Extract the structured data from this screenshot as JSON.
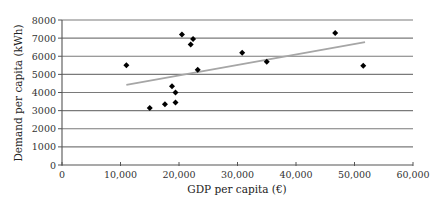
{
  "chart_data": {
    "type": "scatter",
    "title": "",
    "xlabel": "GDP per capita (€)",
    "ylabel": "Demand per capita (kWh)",
    "xlim": [
      0,
      60000
    ],
    "ylim": [
      0,
      8000
    ],
    "x_ticks": [
      0,
      10000,
      20000,
      30000,
      40000,
      50000,
      60000
    ],
    "x_tick_labels": [
      "0",
      "10,000",
      "20,000",
      "30,000",
      "40,000",
      "50,000",
      "60,000"
    ],
    "y_ticks": [
      0,
      1000,
      2000,
      3000,
      4000,
      5000,
      6000,
      7000,
      8000
    ],
    "y_tick_labels": [
      "0",
      "1000",
      "2000",
      "3000",
      "4000",
      "5000",
      "6000",
      "7000",
      "8000"
    ],
    "grid": {
      "horizontal": true,
      "vertical": false
    },
    "legend": null,
    "series": [
      {
        "name": "Countries",
        "marker": "diamond",
        "color": "#000000",
        "points": [
          {
            "x": 11000,
            "y": 5500
          },
          {
            "x": 15000,
            "y": 3150
          },
          {
            "x": 17600,
            "y": 3350
          },
          {
            "x": 18800,
            "y": 4350
          },
          {
            "x": 19400,
            "y": 4000
          },
          {
            "x": 19400,
            "y": 3450
          },
          {
            "x": 20500,
            "y": 7200
          },
          {
            "x": 22000,
            "y": 6650
          },
          {
            "x": 22400,
            "y": 6950
          },
          {
            "x": 23200,
            "y": 5250
          },
          {
            "x": 30800,
            "y": 6200
          },
          {
            "x": 35000,
            "y": 5700
          },
          {
            "x": 46700,
            "y": 7280
          },
          {
            "x": 51500,
            "y": 5470
          }
        ]
      }
    ],
    "trendline": {
      "type": "linear",
      "color": "#a6a6a6",
      "start": {
        "x": 11000,
        "y": 4420
      },
      "end": {
        "x": 51800,
        "y": 6780
      }
    }
  }
}
